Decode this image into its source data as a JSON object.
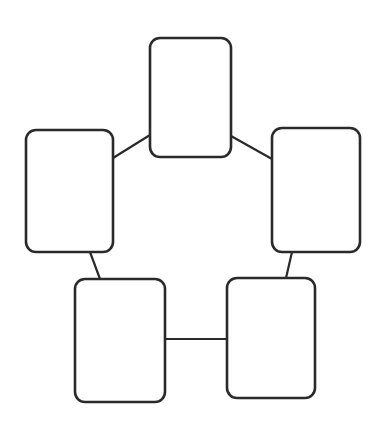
{
  "document": {
    "title": "Blank Five-Node Cycle Diagram",
    "background_color": "#ffffff",
    "canvas_width": 376,
    "canvas_height": 436
  },
  "style": {
    "node_stroke_color": "#2a2a2a",
    "node_fill_color": "#ffffff",
    "node_stroke_width": 2.6,
    "node_corner_radius": 10,
    "connector_stroke_color": "#2a2a2a",
    "connector_stroke_width": 2.2
  },
  "diagram": {
    "type": "cycle",
    "node_count": 5,
    "connector_count": 5,
    "nodes": [
      {
        "id": "node-top",
        "position": "top",
        "label": "",
        "x": 150,
        "y": 38,
        "width": 81,
        "height": 119
      },
      {
        "id": "node-right",
        "position": "right",
        "label": "",
        "x": 272,
        "y": 128,
        "width": 88,
        "height": 124
      },
      {
        "id": "node-bottom-right",
        "position": "bottom-right",
        "label": "",
        "x": 227,
        "y": 278,
        "width": 88,
        "height": 120
      },
      {
        "id": "node-bottom-left",
        "position": "bottom-left",
        "label": "",
        "x": 75,
        "y": 279,
        "width": 90,
        "height": 123
      },
      {
        "id": "node-left",
        "position": "left",
        "label": "",
        "x": 26,
        "y": 130,
        "width": 87,
        "height": 122
      }
    ],
    "connectors": [
      {
        "id": "connector-left-to-top",
        "from": "node-left",
        "to": "node-top",
        "x1": 113,
        "y1": 158,
        "x2": 150,
        "y2": 135
      },
      {
        "id": "connector-top-to-right",
        "from": "node-top",
        "to": "node-right",
        "x1": 231,
        "y1": 136,
        "x2": 272,
        "y2": 159
      },
      {
        "id": "connector-right-to-bottom-right",
        "from": "node-right",
        "to": "node-bottom-right",
        "x1": 292,
        "y1": 252,
        "x2": 286,
        "y2": 278
      },
      {
        "id": "connector-bottom-right-to-bottom-left",
        "from": "node-bottom-right",
        "to": "node-bottom-left",
        "x1": 227,
        "y1": 339,
        "x2": 165,
        "y2": 339
      },
      {
        "id": "connector-bottom-left-to-left",
        "from": "node-bottom-left",
        "to": "node-left",
        "x1": 100,
        "y1": 279,
        "x2": 90,
        "y2": 252
      }
    ]
  }
}
